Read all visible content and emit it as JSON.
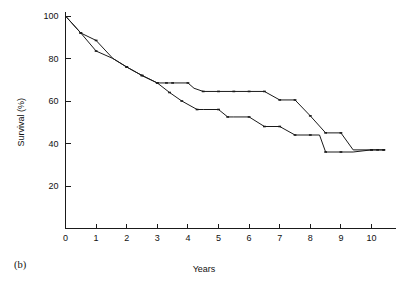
{
  "figure": {
    "panel_label": "(b)",
    "ylabel": "Survival (%)",
    "xlabel": "Years"
  },
  "chart_data": {
    "type": "line",
    "title": "",
    "subtitle": "",
    "xlabel": "Years",
    "ylabel": "Survival (%)",
    "xlim": [
      0,
      10.8
    ],
    "ylim": [
      0,
      100
    ],
    "xticks": [
      0,
      1,
      2,
      3,
      4,
      5,
      6,
      7,
      8,
      9,
      10
    ],
    "xticklabels": [
      "0",
      "1",
      "2",
      "3",
      "4",
      "5",
      "6",
      "7",
      "8",
      "9",
      "10"
    ],
    "yticks": [
      20,
      40,
      60,
      80,
      100
    ],
    "yticklabels": [
      "20",
      "40",
      "60",
      "80",
      "100"
    ],
    "grid": false,
    "legend": "none",
    "annotations": [
      "(b)"
    ],
    "series": [
      {
        "name": "upper-curve",
        "color": "#1a1a1a",
        "x": [
          0.0,
          0.5,
          1.0,
          1.55,
          2.0,
          2.5,
          3.0,
          3.3,
          3.5,
          4.0,
          4.2,
          4.5,
          5.0,
          5.5,
          6.0,
          6.5,
          7.0,
          7.5,
          8.0,
          8.5,
          9.0,
          9.4,
          10.0,
          10.4
        ],
        "y": [
          100.0,
          92.0,
          88.5,
          80.0,
          76.0,
          72.0,
          68.5,
          68.5,
          68.5,
          68.5,
          66.0,
          64.5,
          64.5,
          64.5,
          64.5,
          64.5,
          60.5,
          60.5,
          53.0,
          45.0,
          45.0,
          37.0,
          37.0,
          37.0
        ],
        "censor_x": [
          0.5,
          1.0,
          2.0,
          2.5,
          3.0,
          3.3,
          3.5,
          4.0,
          4.5,
          5.0,
          5.5,
          6.0,
          6.5,
          7.0,
          7.5,
          8.0,
          8.5,
          9.0,
          10.0,
          10.4
        ],
        "censor_y": [
          92.0,
          88.5,
          76.0,
          72.0,
          68.5,
          68.5,
          68.5,
          68.5,
          64.5,
          64.5,
          64.5,
          64.5,
          64.5,
          60.5,
          60.5,
          53.0,
          45.0,
          45.0,
          37.0,
          37.0
        ]
      },
      {
        "name": "lower-curve",
        "color": "#1a1a1a",
        "x": [
          0.0,
          0.5,
          1.0,
          1.55,
          2.0,
          2.5,
          3.0,
          3.4,
          3.8,
          4.3,
          4.5,
          5.0,
          5.3,
          5.5,
          6.0,
          6.5,
          7.0,
          7.5,
          8.0,
          8.3,
          8.5,
          9.0,
          9.4,
          10.0,
          10.4
        ],
        "y": [
          100.0,
          92.0,
          83.5,
          80.0,
          76.0,
          72.0,
          68.5,
          64.0,
          60.0,
          56.0,
          56.0,
          56.0,
          52.5,
          52.5,
          52.5,
          48.0,
          48.0,
          44.0,
          44.0,
          44.0,
          36.0,
          36.0,
          36.0,
          37.0,
          37.0
        ],
        "censor_x": [
          0.5,
          1.0,
          2.0,
          2.5,
          3.0,
          3.4,
          3.8,
          4.3,
          5.0,
          5.3,
          6.0,
          6.5,
          7.0,
          7.5,
          8.0,
          8.5,
          9.0,
          10.0,
          10.2,
          10.4
        ],
        "censor_y": [
          92.0,
          83.5,
          76.0,
          72.0,
          68.5,
          64.0,
          60.0,
          56.0,
          56.0,
          52.5,
          52.5,
          48.0,
          48.0,
          44.0,
          44.0,
          36.0,
          36.0,
          37.0,
          37.0,
          37.0
        ]
      }
    ]
  }
}
